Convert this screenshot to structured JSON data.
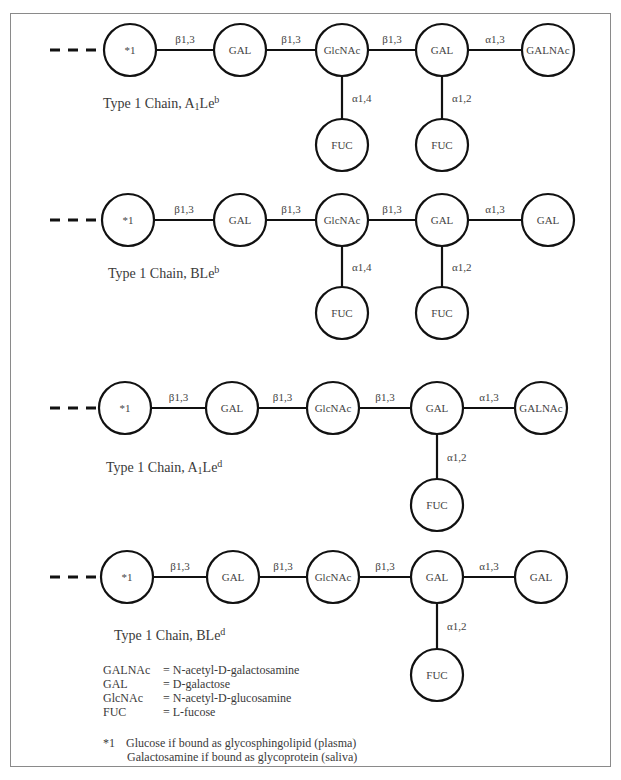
{
  "diagrams": [
    {
      "caption": {
        "prefix": "Type 1 Chain, ",
        "base": "A",
        "sub": "1",
        "mid": "Le",
        "sup": "b"
      },
      "chain": [
        "*1",
        "GAL",
        "GlcNAc",
        "GAL",
        "GALNAc"
      ],
      "links": [
        "β1,3",
        "β1,3",
        "β1,3",
        "α1,3"
      ],
      "branches": [
        {
          "parent_index": 2,
          "node": "FUC",
          "link": "α1,4"
        },
        {
          "parent_index": 3,
          "node": "FUC",
          "link": "α1,2"
        }
      ]
    },
    {
      "caption": {
        "prefix": "Type 1 Chain, ",
        "base": "B",
        "sub": "",
        "mid": "Le",
        "sup": "b"
      },
      "chain": [
        "*1",
        "GAL",
        "GlcNAc",
        "GAL",
        "GAL"
      ],
      "links": [
        "β1,3",
        "β1,3",
        "β1,3",
        "α1,3"
      ],
      "branches": [
        {
          "parent_index": 2,
          "node": "FUC",
          "link": "α1,4"
        },
        {
          "parent_index": 3,
          "node": "FUC",
          "link": "α1,2"
        }
      ]
    },
    {
      "caption": {
        "prefix": "Type 1 Chain, ",
        "base": "A",
        "sub": "1",
        "mid": "Le",
        "sup": "d"
      },
      "chain": [
        "*1",
        "GAL",
        "GlcNAc",
        "GAL",
        "GALNAc"
      ],
      "links": [
        "β1,3",
        "β1,3",
        "β1,3",
        "α1,3"
      ],
      "branches": [
        {
          "parent_index": 3,
          "node": "FUC",
          "link": "α1,2"
        }
      ]
    },
    {
      "caption": {
        "prefix": "Type 1 Chain, ",
        "base": "B",
        "sub": "",
        "mid": "Le",
        "sup": "d"
      },
      "chain": [
        "*1",
        "GAL",
        "GlcNAc",
        "GAL",
        "GAL"
      ],
      "links": [
        "β1,3",
        "β1,3",
        "β1,3",
        "α1,3"
      ],
      "branches": [
        {
          "parent_index": 3,
          "node": "FUC",
          "link": "α1,2"
        }
      ]
    }
  ],
  "legend": [
    {
      "key": "GALNAc",
      "value": "= N-acetyl-D-galactosamine"
    },
    {
      "key": "GAL",
      "value": "= D-galactose"
    },
    {
      "key": "GlcNAc",
      "value": "= N-acetyl-D-glucosamine"
    },
    {
      "key": "FUC",
      "value": "= L-fucose"
    }
  ],
  "note": {
    "key": "*1",
    "lines": [
      "Glucose if bound as glycosphingolipid (plasma)",
      "Galactosamine if bound as glycoprotein (saliva)"
    ]
  }
}
